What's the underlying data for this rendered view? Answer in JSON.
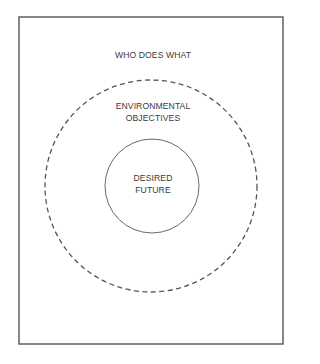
{
  "diagram": {
    "type": "nested-circles",
    "frame": {
      "x": 19,
      "y": 17,
      "width": 264,
      "height": 327,
      "stroke": "#555555"
    },
    "outer_circle": {
      "cx": 151,
      "cy": 186,
      "r": 106,
      "style": "dashed",
      "stroke": "#555555"
    },
    "inner_circle": {
      "cx": 152,
      "cy": 186,
      "r": 47,
      "style": "solid",
      "stroke": "#666666"
    },
    "labels": {
      "outer_region": "WHO DOES WHAT",
      "middle_region": "ENVIRONMENTAL\nOBJECTIVES",
      "inner_region": "DESIRED\nFUTURE"
    }
  }
}
